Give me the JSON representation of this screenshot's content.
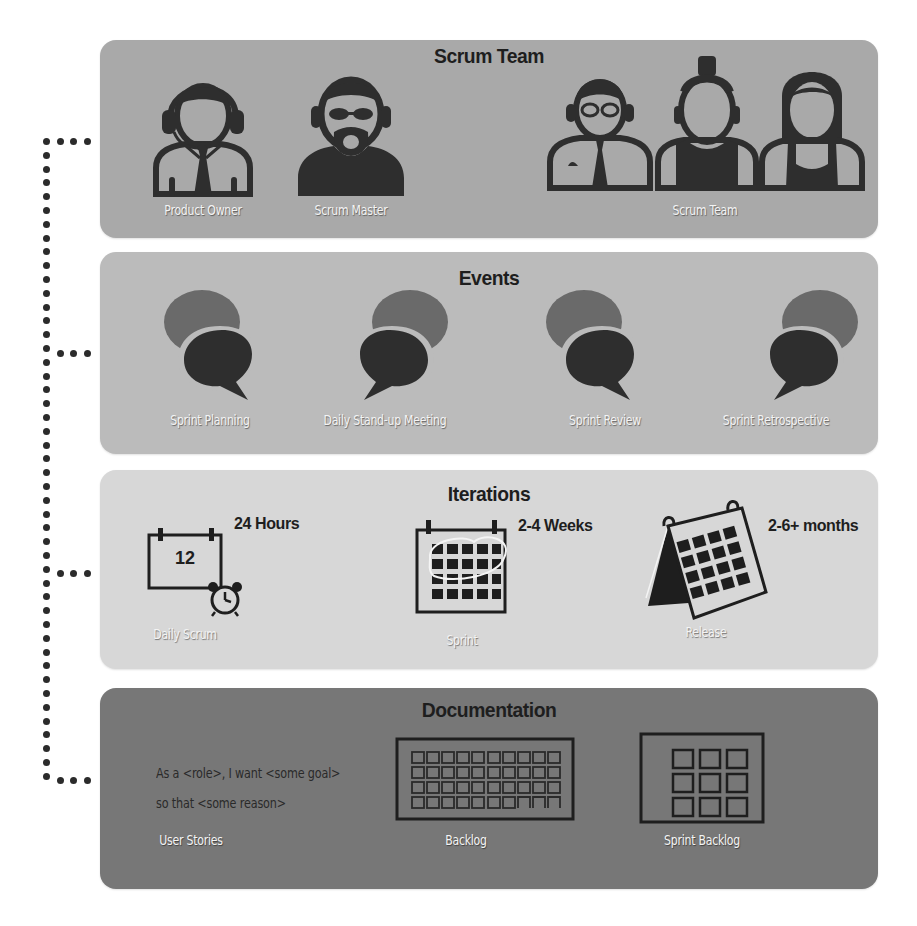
{
  "colors": {
    "panel_team": "#a9a9a9",
    "panel_events": "#bbbbbb",
    "panel_iterations": "#d7d7d7",
    "panel_documentation": "#777777",
    "icon_dark": "#2e2e2e",
    "bubble_back": "#6a6a6a",
    "connector_dots": "#2b2b2b"
  },
  "team": {
    "title": "Scrum Team",
    "roles": [
      {
        "label": "Product Owner",
        "icon": "headset-person-icon"
      },
      {
        "label": "Scrum Master",
        "icon": "bearded-person-sunglasses-icon"
      },
      {
        "label": "Scrum Team",
        "icon": "team-members-icon"
      }
    ]
  },
  "events": {
    "title": "Events",
    "items": [
      {
        "label": "Sprint Planning",
        "icon": "speech-bubbles-icon"
      },
      {
        "label": "Daily Stand-up Meeting",
        "icon": "speech-bubbles-icon"
      },
      {
        "label": "Sprint Review",
        "icon": "speech-bubbles-icon"
      },
      {
        "label": "Sprint Retrospective",
        "icon": "speech-bubbles-icon"
      }
    ]
  },
  "iterations": {
    "title": "Iterations",
    "items": [
      {
        "label": "Daily Scrum",
        "duration": "24 Hours",
        "calendar_day": "12",
        "icon": "calendar-alarm-icon"
      },
      {
        "label": "Sprint",
        "duration": "2-4 Weeks",
        "icon": "calendar-month-icon"
      },
      {
        "label": "Release",
        "duration": "2-6+ months",
        "icon": "desk-calendar-icon"
      }
    ]
  },
  "documentation": {
    "title": "Documentation",
    "user_story_line1": "As a <role>, I want <some goal>",
    "user_story_line2": "so that <some reason>",
    "items": [
      {
        "label": "User Stories"
      },
      {
        "label": "Backlog",
        "icon": "backlog-grid-icon"
      },
      {
        "label": "Sprint Backlog",
        "icon": "sprint-backlog-grid-icon"
      }
    ]
  }
}
